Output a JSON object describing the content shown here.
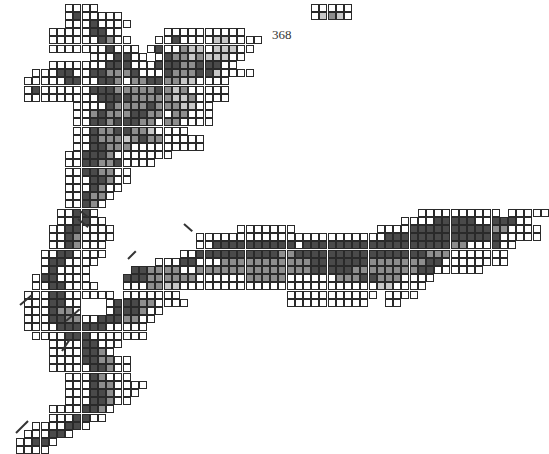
{
  "figure": {
    "label": "368",
    "label_pos": {
      "x": 272,
      "y": 27
    },
    "grid": {
      "origin_x": 0,
      "origin_y": 4,
      "pitch": 8.2,
      "legend": {
        ".": "none",
        "0": "white",
        "1": "light-gray",
        "2": "mid-gray",
        "3": "dark-gray",
        "4": "black"
      },
      "rows": [
        "........0000..........................00000.....",
        "........0300000.......................01210.....",
        "........00030000..............................",
        "......000003300.....0000000000.....",
        "......0000003200...0030000110000...",
        "......00000003000.0300211011100....",
        "...........0003300.03221211100.....",
        "......00000003330003332233300......",
        "....000330033222300032223310000....",
        "...0000033003320223322110000.......",
        "...0300000033322222321200000.......",
        "...0000000003333222221120000.......",
        ".........00003222232221100.........",
        ".........00232223322022000.........",
        ".........00332333220220000.........",
        ".........00322332210000............",
        ".........0032221232200000..........",
        ".........0033222000000000..........",
        "........0033320000000..............",
        "........00332230000................",
        "........00332200...................",
        "........00033200...................",
        "........0003200....................",
        "........003220.....................",
        "........00320......................",
        ".......00330.......................................0000000000.00000",
        ".......003300....................................0000333330033300",
        "......00330000...............0000000..........00003333333333220000",
        "......00320000..........000000000000000000000003333333333333300000",
        "......0032000...........003333333333033333333333333333322000300...",
        ".....00330000.........0033333333332233333333333333332220000000....",
        ".....0330000.......0003300022222222222333333322222223300000000.....",
        ".....030000.....3322220022222222222222333332222222233000000........",
        "....0330000....33322222200000022222000000222332220000.............",
        "....00330000...0002211000000000000000000000000110000..............",
        "...00033000000.0000000.............00000000000.0000...............",
        "...0003300...0333220000............0000000000..00.................",
        "...0003220...0333200...............................................",
        "...0003322003332200................................................",
        "...000033333300000.................................................",
        "....00003330000000.................................................",
        "......000033000....................................................",
        "......00003320.....................................................",
        "......0000332200...................................................",
        "......0000033200...................................................",
        "........00032000...................................................",
        "........0003220000.................................................",
        "........000332000..................................................",
        "........00033200...................................................",
        "......00003320.....................................................",
        "......0003300......................................................",
        "....0000330........................................................",
        "...000330..........................................................",
        "..00330............................................................",
        "..0000............................................................."
      ]
    },
    "strokes": [
      {
        "x1": 66,
        "y1": 320,
        "x2": 80,
        "y2": 308
      },
      {
        "x1": 62,
        "y1": 350,
        "x2": 70,
        "y2": 338
      },
      {
        "x1": 20,
        "y1": 304,
        "x2": 32,
        "y2": 294
      },
      {
        "x1": 78,
        "y1": 218,
        "x2": 88,
        "y2": 226
      },
      {
        "x1": 80,
        "y1": 210,
        "x2": 88,
        "y2": 216
      },
      {
        "x1": 16,
        "y1": 432,
        "x2": 28,
        "y2": 420
      },
      {
        "x1": 184,
        "y1": 223,
        "x2": 192,
        "y2": 230
      },
      {
        "x1": 128,
        "y1": 258,
        "x2": 136,
        "y2": 250
      }
    ]
  }
}
